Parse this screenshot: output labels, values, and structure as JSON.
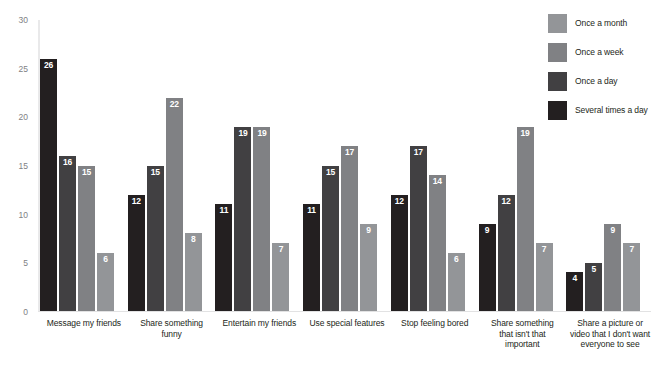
{
  "chart_data": {
    "type": "bar",
    "title": "",
    "subtitle": "",
    "xlabel": "",
    "ylabel": "",
    "ylim": [
      0,
      30
    ],
    "yticks": [
      0,
      5,
      10,
      15,
      20,
      25,
      30
    ],
    "grid": false,
    "legend_position": "top-right",
    "categories": [
      "Message my friends",
      "Share something funny",
      "Entertain my friends",
      "Use special features",
      "Stop feeling bored",
      "Share something that isn't that important",
      "Share a picture or video that I don't want everyone to see"
    ],
    "series": [
      {
        "name": "Several times a day",
        "color": "#231f20",
        "values": [
          26,
          12,
          11,
          11,
          12,
          9,
          4
        ]
      },
      {
        "name": "Once a day",
        "color": "#414042",
        "values": [
          16,
          15,
          19,
          15,
          17,
          12,
          5
        ]
      },
      {
        "name": "Once a week",
        "color": "#808184",
        "values": [
          15,
          22,
          19,
          17,
          14,
          19,
          9
        ]
      },
      {
        "name": "Once a month",
        "color": "#939598",
        "values": [
          6,
          8,
          7,
          9,
          6,
          7,
          7
        ]
      }
    ]
  },
  "legend": {
    "items": [
      {
        "label": "Once a month",
        "color": "#939598"
      },
      {
        "label": "Once a week",
        "color": "#808184"
      },
      {
        "label": "Once a day",
        "color": "#414042"
      },
      {
        "label": "Several times a day",
        "color": "#231f20"
      }
    ]
  },
  "category_lines": [
    [
      "Message my friends"
    ],
    [
      "Share something funny"
    ],
    [
      "Entertain my friends"
    ],
    [
      "Use special features"
    ],
    [
      "Stop feeling bored"
    ],
    [
      "Share something",
      "that isn't that",
      "important"
    ],
    [
      "Share a picture or",
      "video that I don't want",
      "everyone to see"
    ]
  ]
}
